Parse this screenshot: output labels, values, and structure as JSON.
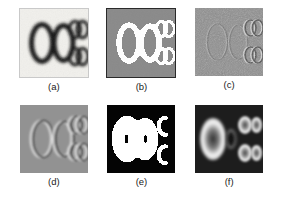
{
  "figure": {
    "title": "",
    "layout": {
      "rows": 2,
      "cols": 3,
      "panel_px": 68
    },
    "background_color": "#ffffff"
  },
  "panels": [
    {
      "id": "a",
      "caption": "(a)",
      "name": "panel-a-original",
      "description": "original grayscale image, light background with dark blurred ring-shaped objects",
      "background_color": "#efeeea",
      "foreground_color": "#1b1b1b",
      "border_color": "#c9c9c9",
      "polarity": "dark-on-light",
      "style": "blurred"
    },
    {
      "id": "b",
      "caption": "(b)",
      "name": "panel-b-binary",
      "description": "binary segmentation, white objects on mid-gray background",
      "background_color": "#8a8a8a",
      "foreground_color": "#ffffff",
      "border_color": "#2a2a2a",
      "polarity": "light-on-gray",
      "style": "binary"
    },
    {
      "id": "c",
      "caption": "(c)",
      "name": "panel-c-noise-residual",
      "description": "noisy residual, faint object outlines barely visible in uniform gray noise",
      "background_color": "#8f8f8f",
      "foreground_color": "#b4b4b4",
      "border_color": "#8f8f8f",
      "polarity": "low-contrast",
      "style": "noise"
    },
    {
      "id": "d",
      "caption": "(d)",
      "name": "panel-d-emboss-gradient",
      "description": "embossed gradient map, bright and dark edges around each object",
      "background_color": "#8d8d8d",
      "foreground_color": "#d8d8d8",
      "border_color": "#8d8d8d",
      "polarity": "emboss",
      "style": "emboss"
    },
    {
      "id": "e",
      "caption": "(e)",
      "name": "panel-e-over-threshold",
      "description": "over-thresholded binary, left objects merged into one solid white blob, right objects appear as C shaped arcs on black",
      "background_color": "#040404",
      "foreground_color": "#ffffff",
      "border_color": "#040404",
      "polarity": "light-on-black",
      "style": "binary-merged"
    },
    {
      "id": "f",
      "caption": "(f)",
      "name": "panel-f-distance-glow",
      "description": "distance/glow transform, bright halos around object boundaries on dark background",
      "background_color": "#1d1d1d",
      "foreground_color": "#f2f2f2",
      "border_color": "#1d1d1d",
      "polarity": "glow-on-dark",
      "style": "glow"
    }
  ],
  "objects": {
    "count": 6,
    "arrangement": "two large vertical rings on the left, four smaller rings in a 2x2 block on the right",
    "large_rings": [
      {
        "name": "large-ring-left",
        "cx": 22,
        "cy": 34,
        "rx": 11,
        "ry": 19
      },
      {
        "name": "large-ring-right",
        "cx": 44,
        "cy": 34,
        "rx": 10,
        "ry": 18
      }
    ],
    "small_rings": [
      {
        "name": "small-ring-top-left",
        "cx": 55,
        "cy": 21,
        "rx": 7,
        "ry": 9
      },
      {
        "name": "small-ring-top-right",
        "cx": 62,
        "cy": 21,
        "rx": 7,
        "ry": 9
      },
      {
        "name": "small-ring-bottom-left",
        "cx": 55,
        "cy": 48,
        "rx": 7,
        "ry": 9
      },
      {
        "name": "small-ring-bottom-right",
        "cx": 62,
        "cy": 48,
        "rx": 7,
        "ry": 9
      }
    ]
  }
}
